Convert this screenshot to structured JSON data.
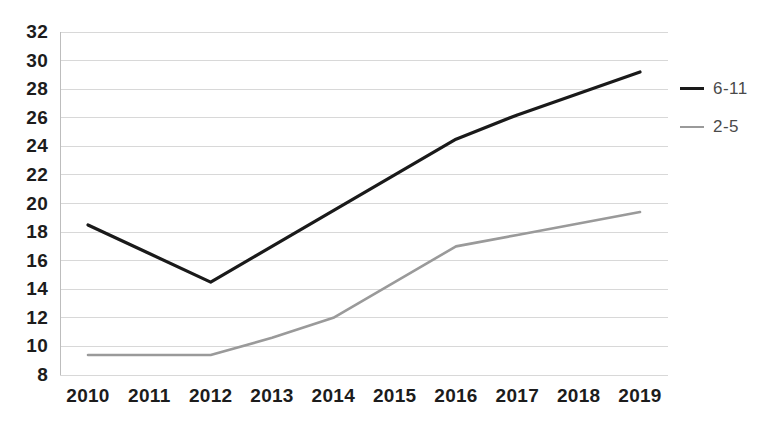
{
  "chart_data": {
    "type": "line",
    "title": "",
    "subtitle": "",
    "xlabel": "",
    "ylabel": "",
    "categories": [
      "2010",
      "2011",
      "2012",
      "2013",
      "2014",
      "2015",
      "2016",
      "2017",
      "2018",
      "2019"
    ],
    "series": [
      {
        "name": "6-11",
        "color": "#1a1a1a",
        "values": [
          18.5,
          16.5,
          14.5,
          17.0,
          19.5,
          22.0,
          24.5,
          26.2,
          27.7,
          29.2
        ]
      },
      {
        "name": "2-5",
        "color": "#9a9a9a",
        "values": [
          9.4,
          9.4,
          9.4,
          10.6,
          12.0,
          14.5,
          17.0,
          17.8,
          18.6,
          19.4
        ]
      }
    ],
    "ylim": [
      8,
      32
    ],
    "ytick_step": 2,
    "ytick_labels": [
      "32",
      "30",
      "28",
      "26",
      "24",
      "22",
      "20",
      "18",
      "16",
      "14",
      "12",
      "10",
      "8"
    ],
    "grid": true,
    "grid_color": "#d8d8d8",
    "axis_color": "#bdbdbd",
    "legend_position": "right",
    "legend": [
      {
        "label": "6-11",
        "color": "#1a1a1a"
      },
      {
        "label": "2-5",
        "color": "#9a9a9a"
      }
    ]
  }
}
